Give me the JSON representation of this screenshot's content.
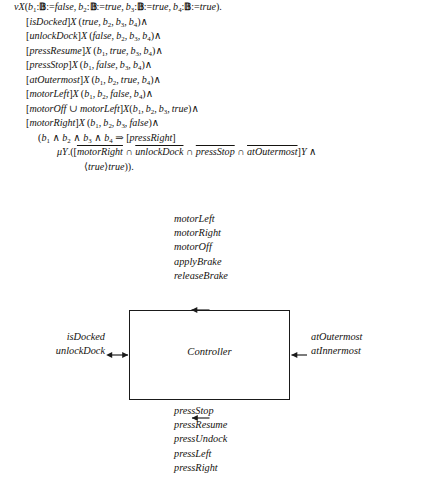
{
  "formula": {
    "lines": [
      {
        "id": "nu-binder",
        "indent": 0,
        "text": "νX(b₁:𝔹:=false, b₂:𝔹:=true, b₃:𝔹:=true, b₄:𝔹:=true)."
      },
      {
        "id": "isdocked",
        "indent": 1,
        "text": "[isDocked]X(true, b₂, b₃, b₄)∧"
      },
      {
        "id": "unlockdock",
        "indent": 1,
        "text": "[unlockDock]X(false, b₂, b₃, b₄)∧"
      },
      {
        "id": "pressresume",
        "indent": 1,
        "text": "[pressResume]X(b₁, true, b₃, b₄)∧"
      },
      {
        "id": "pressstop",
        "indent": 1,
        "text": "[pressStop]X(b₁, false, b₃, b₄)∧"
      },
      {
        "id": "atoutermost",
        "indent": 1,
        "text": "[atOutermost]X(b₁, b₂, true, b₄)∧"
      },
      {
        "id": "motorleft",
        "indent": 1,
        "text": "[motorLeft]X(b₁, b₂, false, b₄)∧"
      },
      {
        "id": "motoroff-union-motorleft",
        "indent": 1,
        "text": "[motorOff ∪ motorLeft]X(b₁, b₂, b₃, true)∧"
      },
      {
        "id": "motorright",
        "indent": 1,
        "text": "[motorRight]X(b₁, b₂, b₃, false)∧"
      },
      {
        "id": "implication",
        "indent": 2,
        "text": "(b₁ ∧ b₂ ∧ b₃ ∧ b₄ ⇒ [pressRight]"
      },
      {
        "id": "mu-binder",
        "indent": 3,
        "text": "μY.([motorRight ∩ unlockDock ∩ pressStop ∩ atOutermost]Y ∧"
      },
      {
        "id": "diamond-true",
        "indent": 4,
        "text": "⟨true⟩true))."
      }
    ],
    "mu_line_parts": {
      "prefix": "μY.([",
      "bar1": "motorRight",
      "cap1": " ∩ ",
      "bar2": "unlockDock",
      "cap2": " ∩ ",
      "bar3": "pressStop",
      "cap3": " ∩ ",
      "bar4": "atOutermost",
      "suffix": "]Y ∧"
    }
  },
  "diagram": {
    "component": {
      "label": "Controller"
    },
    "top_ports": {
      "direction": "out",
      "arrow": "up-arrow",
      "items": [
        "motorLeft",
        "motorRight",
        "motorOff",
        "applyBrake",
        "releaseBrake"
      ]
    },
    "bottom_ports": {
      "direction": "in",
      "arrow": "up-arrow",
      "items": [
        "pressStop",
        "pressResume",
        "pressUndock",
        "pressLeft",
        "pressRight"
      ]
    },
    "left_ports": {
      "direction": "bidirectional",
      "arrow": "double-arrow",
      "items": [
        "isDocked",
        "unlockDock"
      ]
    },
    "right_ports": {
      "direction": "in",
      "arrow": "left-arrow",
      "items": [
        "atOutermost",
        "atInnermost"
      ]
    }
  },
  "style": {
    "ink": "#15130f",
    "line": "#1a1a1a",
    "background": "#ffffff"
  }
}
